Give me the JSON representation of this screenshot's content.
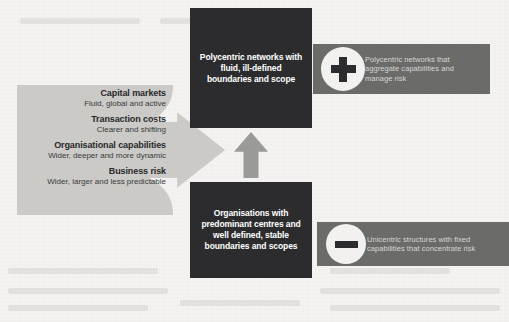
{
  "diagram": {
    "drivers": [
      {
        "title": "Capital markets",
        "sub": "Fluid, global and active"
      },
      {
        "title": "Transaction costs",
        "sub": "Clearer and shifting"
      },
      {
        "title": "Organisational capabilities",
        "sub": "Wider, deeper and more dynamic"
      },
      {
        "title": "Business risk",
        "sub": "Wider, larger and less predictable"
      }
    ],
    "concepts": {
      "top": "Polycentric networks with fluid, ill-defined boundaries and scope",
      "bottom": "Organisations with predominant centres and well defined, stable boundaries and scopes"
    },
    "outcomes": {
      "top": "Polycentric networks that aggregate capabilities and manage risk",
      "bottom": "Unicentric structures with fixed capabilities that concentrate risk"
    },
    "icons": {
      "plus": "plus-icon",
      "minus": "minus-icon",
      "right_arrow": "arrow-right-icon",
      "up_arrow": "arrow-up-icon"
    },
    "colors": {
      "dark_box": "#2c2c2e",
      "mid_gray_panel": "#6b6b69",
      "light_gray_panel": "#cbcac6",
      "arrow_gray": "#9a9a98",
      "page_background": "#f4f3f1",
      "circle_fill": "#f2f1ef"
    }
  }
}
